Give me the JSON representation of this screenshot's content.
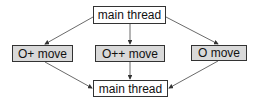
{
  "diagram": {
    "nodes": [
      {
        "id": "top",
        "label": "main thread",
        "fill": "#ffffff"
      },
      {
        "id": "left",
        "label": "O+ move",
        "fill": "#d9d9d9"
      },
      {
        "id": "middle",
        "label": "O++ move",
        "fill": "#d9d9d9"
      },
      {
        "id": "right",
        "label": "O move",
        "fill": "#d9d9d9"
      },
      {
        "id": "bottom",
        "label": "main thread",
        "fill": "#ffffff"
      }
    ],
    "edges": [
      {
        "from": "top",
        "to": "left"
      },
      {
        "from": "top",
        "to": "middle"
      },
      {
        "from": "top",
        "to": "right"
      },
      {
        "from": "left",
        "to": "bottom"
      },
      {
        "from": "middle",
        "to": "bottom"
      },
      {
        "from": "right",
        "to": "bottom"
      }
    ]
  }
}
